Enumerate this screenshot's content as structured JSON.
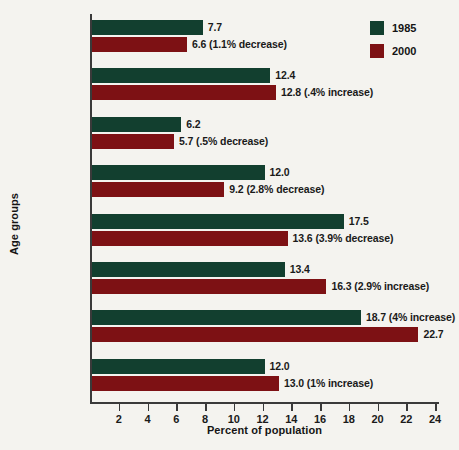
{
  "chart_data": {
    "type": "bar",
    "orientation": "horizontal",
    "title": "",
    "xlabel": "Percent of population",
    "ylabel": "Age groups",
    "xlim": [
      0,
      25
    ],
    "xticks": [
      2,
      4,
      6,
      8,
      10,
      12,
      14,
      16,
      18,
      20,
      22,
      24
    ],
    "grid": false,
    "legend_position": "top-right",
    "categories": [
      "Younger than 5",
      "5–13",
      "14–17",
      "18–24",
      "25–34",
      "35–44",
      "45–64",
      "65 and older"
    ],
    "series": [
      {
        "name": "1985",
        "color": "#123f2f",
        "values": [
          7.7,
          12.4,
          6.2,
          12.0,
          17.5,
          13.4,
          18.7,
          12.0
        ],
        "labels": [
          "7.7",
          "12.4",
          "6.2",
          "12.0",
          "17.5",
          "13.4",
          "18.7 (4% increase)",
          "12.0"
        ]
      },
      {
        "name": "2000",
        "color": "#7d1114",
        "values": [
          6.6,
          12.8,
          5.7,
          9.2,
          13.6,
          16.3,
          22.7,
          13.0
        ],
        "labels": [
          "6.6 (1.1% decrease)",
          "12.8 (.4% increase)",
          "5.7 (.5% decrease)",
          "9.2 (2.8% decrease)",
          "13.6 (3.9% decrease)",
          "16.3 (2.9% increase)",
          "22.7",
          "13.0 (1% increase)"
        ]
      }
    ]
  },
  "legend": {
    "items": [
      {
        "label": "1985",
        "color": "#123f2f"
      },
      {
        "label": "2000",
        "color": "#7d1114"
      }
    ]
  },
  "axes": {
    "x_title": "Percent of population",
    "y_title": "Age groups"
  },
  "colors": {
    "series_1985": "#123f2f",
    "series_2000": "#7d1114",
    "background": "#f4f3ef",
    "axis": "#3a3a3a",
    "text": "#1a1a1a"
  }
}
